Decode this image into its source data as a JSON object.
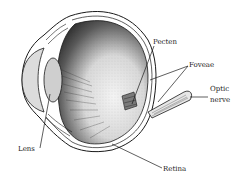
{
  "diagram": {
    "labels": {
      "pecten": "Pecten",
      "foveae": "Foveae",
      "optic_nerve_line1": "Optic",
      "optic_nerve_line2": "nerve",
      "lens": "Lens",
      "retina": "Retina"
    },
    "colors": {
      "line": "#1a1a1a",
      "lens_fill": "#cfcfcf",
      "cornea_fill": "#dcdcdc",
      "interior_dark": "#3a3a3a",
      "interior_light": "#f2f2f2",
      "background": "#ffffff"
    }
  }
}
